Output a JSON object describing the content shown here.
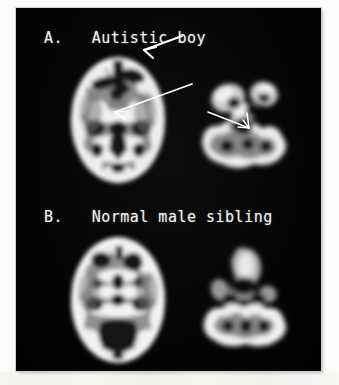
{
  "figure": {
    "background_color": "#fbfbf9",
    "plate_color": "#050505",
    "modality": "PET brain scan",
    "colormap": "grayscale"
  },
  "panels": [
    {
      "id": "A",
      "label": "A.   Autistic boy",
      "subject": "Autistic boy",
      "scans": [
        {
          "name": "axial-slice-upper-left",
          "view": "axial",
          "level": "basal ganglia / lateral ventricles"
        },
        {
          "name": "axial-slice-lower-right",
          "view": "axial",
          "level": "temporal lobe / cerebellum"
        }
      ],
      "annotations": [
        {
          "name": "arrow-frontal",
          "target": "right frontal hypometabolic region",
          "color": "#ffffff"
        },
        {
          "name": "arrow-basal-ganglia",
          "target": "right basal ganglia region",
          "color": "#ffffff"
        },
        {
          "name": "arrow-temporal",
          "target": "right medial temporal region",
          "color": "#ffffff"
        }
      ]
    },
    {
      "id": "B",
      "label": "B.   Normal male sibling",
      "subject": "Normal male sibling",
      "scans": [
        {
          "name": "axial-slice-upper-left",
          "view": "axial",
          "level": "basal ganglia / lateral ventricles"
        },
        {
          "name": "axial-slice-lower-right",
          "view": "axial",
          "level": "temporal lobe / cerebellum"
        }
      ],
      "annotations": []
    }
  ]
}
